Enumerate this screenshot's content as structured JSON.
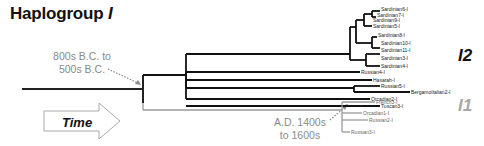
{
  "title": {
    "prefix": "Haplogroup ",
    "italic": "I"
  },
  "annotations": {
    "early": {
      "line1": "800s B.C. to",
      "line2": "500s B.C."
    },
    "late": {
      "line1": "A.D. 1400s",
      "line2": "to 1600s"
    }
  },
  "clades": {
    "i2": {
      "label": "I2",
      "color": "#111111"
    },
    "i1": {
      "label": "I1",
      "color": "#a0a0a0"
    }
  },
  "time_arrow": {
    "label": "Time"
  },
  "colors": {
    "i2_branch": "#111111",
    "i1_branch": "#9a9a9a",
    "annotation_text": "#8a8a8a"
  },
  "leaves": [
    {
      "name": "Sardinian6-I",
      "clade": "I2"
    },
    {
      "name": "Sardinian7-I",
      "clade": "I2"
    },
    {
      "name": "Sardinian9-I",
      "clade": "I2"
    },
    {
      "name": "Sardinian5-I",
      "clade": "I2"
    },
    {
      "name": "Sardinian8-I",
      "clade": "I2"
    },
    {
      "name": "Sardinian10-I",
      "clade": "I2"
    },
    {
      "name": "Sardinian11-I",
      "clade": "I2"
    },
    {
      "name": "Sardinian3-I",
      "clade": "I2"
    },
    {
      "name": "Sardinian4-I",
      "clade": "I2"
    },
    {
      "name": "Russian4-I",
      "clade": "I2"
    },
    {
      "name": "Hasarah-I",
      "clade": "I2"
    },
    {
      "name": "Russian5-I",
      "clade": "I2"
    },
    {
      "name": "BergamoItalian2-I",
      "clade": "I2"
    },
    {
      "name": "Orcadian2-I",
      "clade": "I2"
    },
    {
      "name": "Tuscan3-I",
      "clade": "I2"
    },
    {
      "name": "French3-I",
      "clade": "I1"
    },
    {
      "name": "Orcadian1-I",
      "clade": "I1"
    },
    {
      "name": "Russian2-I",
      "clade": "I1"
    },
    {
      "name": "Russian3-I",
      "clade": "I1"
    }
  ]
}
